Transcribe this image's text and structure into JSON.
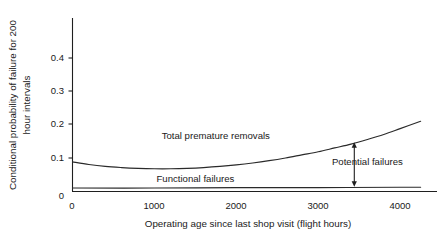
{
  "chart_data": {
    "type": "line",
    "title": "",
    "xlabel": "Operating age since last shop visit (flight hours)",
    "ylabel": "Conditional probability of failure for 200 hour intervals",
    "ylabel_line1": "Conditional probability of failure for 200",
    "ylabel_line2": "hour intervals",
    "xlim": [
      0,
      4450
    ],
    "ylim": [
      0,
      0.45
    ],
    "xticks": [
      0,
      1000,
      2000,
      3000,
      4000
    ],
    "xtick_labels": [
      "0",
      "1000",
      "2000",
      "3000",
      "4000"
    ],
    "yticks": [
      0,
      0.1,
      0.2,
      0.3,
      0.4
    ],
    "ytick_labels": [
      "0",
      "0.1",
      "0.2",
      "0.3",
      "0.4"
    ],
    "grid": false,
    "legend_position": "inline-labels",
    "series": [
      {
        "name": "Total premature removals",
        "label_x": 1750,
        "label_y": 0.137,
        "x": [
          0,
          200,
          400,
          600,
          800,
          1000,
          1200,
          1400,
          1600,
          1800,
          2000,
          2200,
          2400,
          2600,
          2800,
          3000,
          3200,
          3400,
          3600,
          3800,
          4000,
          4250
        ],
        "values": [
          0.077,
          0.07,
          0.065,
          0.062,
          0.06,
          0.059,
          0.059,
          0.06,
          0.062,
          0.065,
          0.069,
          0.074,
          0.08,
          0.087,
          0.095,
          0.103,
          0.113,
          0.123,
          0.135,
          0.148,
          0.163,
          0.182
        ]
      },
      {
        "name": "Functional failures",
        "label_x": 1500,
        "label_y": 0.024,
        "x": [
          0,
          1000,
          2000,
          3000,
          4000,
          4250
        ],
        "values": [
          0.009,
          0.009,
          0.01,
          0.01,
          0.011,
          0.011
        ]
      }
    ],
    "annotations": [
      {
        "text": "Potential failures",
        "type": "double-arrow",
        "x": 3440,
        "y_top": 0.128,
        "y_bottom": 0.012,
        "label_x": 3600,
        "label_y": 0.07
      }
    ]
  }
}
